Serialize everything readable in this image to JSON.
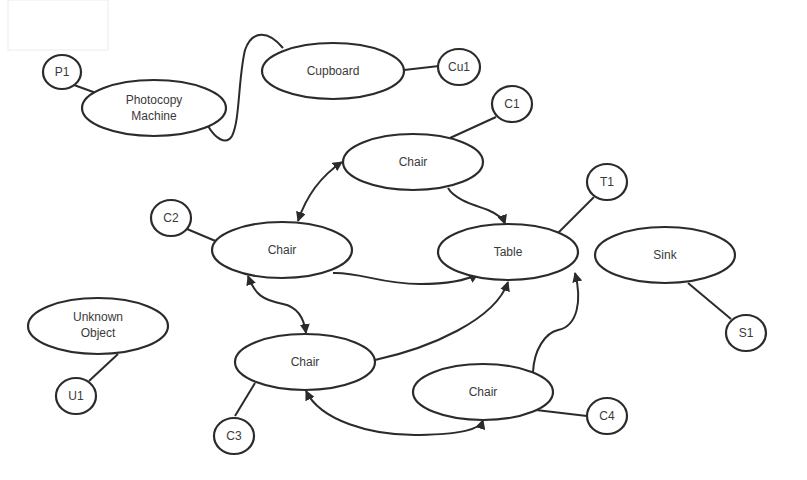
{
  "diagram": {
    "type": "object-graph",
    "colors": {
      "stroke": "#2b2b2b",
      "fill": "#ffffff",
      "text": "#3a3a3a",
      "background": "#ffffff"
    },
    "objects": [
      {
        "id": "photocopy",
        "label_lines": [
          "Photocopy",
          "Machine"
        ],
        "cx": 154,
        "cy": 108,
        "rx": 72,
        "ry": 28
      },
      {
        "id": "cupboard",
        "label_lines": [
          "Cupboard"
        ],
        "cx": 333,
        "cy": 71,
        "rx": 71,
        "ry": 28
      },
      {
        "id": "chair_top",
        "label_lines": [
          "Chair"
        ],
        "cx": 413,
        "cy": 162,
        "rx": 70,
        "ry": 28
      },
      {
        "id": "chair_left",
        "label_lines": [
          "Chair"
        ],
        "cx": 282,
        "cy": 250,
        "rx": 70,
        "ry": 28
      },
      {
        "id": "table",
        "label_lines": [
          "Table"
        ],
        "cx": 508,
        "cy": 252,
        "rx": 70,
        "ry": 28
      },
      {
        "id": "sink",
        "label_lines": [
          "Sink"
        ],
        "cx": 665,
        "cy": 255,
        "rx": 70,
        "ry": 28
      },
      {
        "id": "unknown",
        "label_lines": [
          "Unknown",
          "Object"
        ],
        "cx": 98,
        "cy": 326,
        "rx": 70,
        "ry": 28
      },
      {
        "id": "chair_mid",
        "label_lines": [
          "Chair"
        ],
        "cx": 305,
        "cy": 362,
        "rx": 70,
        "ry": 28
      },
      {
        "id": "chair_right",
        "label_lines": [
          "Chair"
        ],
        "cx": 483,
        "cy": 392,
        "rx": 70,
        "ry": 28
      }
    ],
    "instances": [
      {
        "id": "P1",
        "label": "P1",
        "cx": 62,
        "cy": 72,
        "r": 18,
        "attached_to": "photocopy"
      },
      {
        "id": "Cu1",
        "label": "Cu1",
        "cx": 459,
        "cy": 67,
        "r": 20,
        "attached_to": "cupboard"
      },
      {
        "id": "C1",
        "label": "C1",
        "cx": 512,
        "cy": 104,
        "r": 20,
        "attached_to": "chair_top"
      },
      {
        "id": "T1",
        "label": "T1",
        "cx": 607,
        "cy": 182,
        "r": 20,
        "attached_to": "table"
      },
      {
        "id": "C2",
        "label": "C2",
        "cx": 171,
        "cy": 218,
        "r": 20,
        "attached_to": "chair_left"
      },
      {
        "id": "S1",
        "label": "S1",
        "cx": 746,
        "cy": 333,
        "r": 20,
        "attached_to": "sink"
      },
      {
        "id": "U1",
        "label": "U1",
        "cx": 76,
        "cy": 396,
        "r": 20,
        "attached_to": "unknown"
      },
      {
        "id": "C3",
        "label": "C3",
        "cx": 234,
        "cy": 436,
        "r": 20,
        "attached_to": "chair_mid"
      },
      {
        "id": "C4",
        "label": "C4",
        "cx": 607,
        "cy": 416,
        "r": 20,
        "attached_to": "chair_right"
      }
    ],
    "relations": [
      {
        "from": "photocopy",
        "to": "cupboard",
        "style": "loop-curve"
      },
      {
        "from": "chair_left",
        "to": "chair_top",
        "style": "bidirectional-arrow"
      },
      {
        "from": "chair_top",
        "to": "table",
        "style": "arrow"
      },
      {
        "from": "chair_left",
        "to": "table",
        "style": "arrow"
      },
      {
        "from": "chair_left",
        "to": "chair_mid",
        "style": "bidirectional-arrow"
      },
      {
        "from": "chair_mid",
        "to": "table",
        "style": "arrow"
      },
      {
        "from": "chair_right",
        "to": "table",
        "style": "arrow"
      },
      {
        "from": "chair_mid",
        "to": "chair_right",
        "style": "bidirectional-arrow"
      }
    ]
  }
}
